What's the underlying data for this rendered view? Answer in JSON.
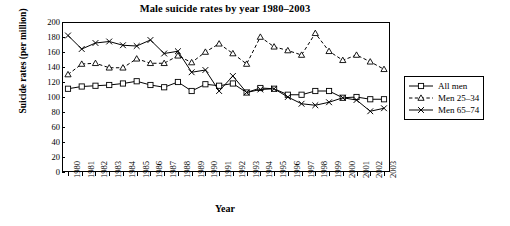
{
  "chart_data": {
    "type": "line",
    "title": "Male suicide rates by year 1980–2003",
    "xlabel": "Year",
    "ylabel": "Suicide rates (per million)",
    "xlim": [
      1980,
      2003
    ],
    "ylim": [
      0,
      200
    ],
    "y_ticks": [
      0,
      20,
      40,
      60,
      80,
      100,
      120,
      140,
      160,
      180,
      200
    ],
    "grid": false,
    "legend_position": "right",
    "categories": [
      "1980",
      "1981",
      "1982",
      "1983",
      "1984",
      "1985",
      "1986",
      "1987",
      "1988",
      "1989",
      "1990",
      "1991",
      "1992",
      "1993",
      "1994",
      "1995",
      "1996",
      "1997",
      "1998",
      "1999",
      "2000",
      "2001",
      "2002",
      "2003"
    ],
    "series": [
      {
        "name": "All men",
        "marker": "square",
        "line": "solid",
        "color": "#000000",
        "values": [
          111,
          114,
          115,
          116,
          118,
          121,
          116,
          113,
          120,
          108,
          117,
          115,
          118,
          106,
          112,
          111,
          103,
          103,
          108,
          108,
          99,
          100,
          97,
          97
        ]
      },
      {
        "name": "Men 25–34",
        "marker": "triangle",
        "line": "dashed",
        "color": "#000000",
        "values": [
          130,
          144,
          145,
          139,
          139,
          151,
          145,
          145,
          155,
          146,
          160,
          171,
          158,
          144,
          180,
          167,
          162,
          156,
          185,
          161,
          149,
          156,
          147,
          137
        ]
      },
      {
        "name": "Men 65–74",
        "marker": "x",
        "line": "solid",
        "color": "#000000",
        "values": [
          182,
          164,
          172,
          174,
          169,
          168,
          176,
          158,
          161,
          133,
          136,
          108,
          128,
          106,
          110,
          111,
          100,
          91,
          89,
          93,
          99,
          96,
          81,
          85
        ]
      }
    ]
  },
  "legend": {
    "items": [
      {
        "label": "All men"
      },
      {
        "label": "Men 25–34"
      },
      {
        "label": "Men 65–74"
      }
    ]
  }
}
